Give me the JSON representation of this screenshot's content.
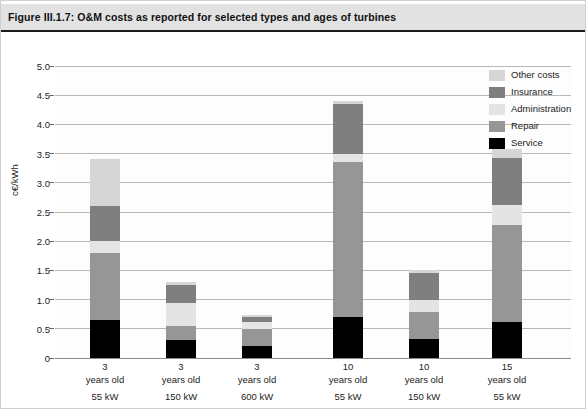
{
  "figure": {
    "title": "Figure III.1.7: O&M costs as reported for selected types and ages of turbines"
  },
  "colors": {
    "service": "#000000",
    "repair": "#969696",
    "administration": "#e4e4e4",
    "insurance": "#7f7f7f",
    "other_costs": "#d6d6d6",
    "gridline": "#b8b8b8",
    "banner_background": "#e2e2e2",
    "plot_background": "#fdfdfd"
  },
  "legend": {
    "position": "right",
    "items": [
      {
        "label": "Other costs",
        "color": "#d6d6d6"
      },
      {
        "label": "Insurance",
        "color": "#7f7f7f"
      },
      {
        "label": "Administration",
        "color": "#e4e4e4"
      },
      {
        "label": "Repair",
        "color": "#969696"
      },
      {
        "label": "Service",
        "color": "#000000"
      }
    ]
  },
  "chart_data": {
    "type": "bar",
    "stacked": true,
    "title": "Figure III.1.7: O&M costs as reported for selected types and ages of turbines",
    "xlabel": "",
    "ylabel": "c€/kWh",
    "ylim": [
      0,
      5.0
    ],
    "ytick_labels": [
      "0",
      "0.5",
      "1.0",
      "1.5",
      "2.0",
      "2.5",
      "3.0",
      "3.5",
      "4.0",
      "4.5",
      "5.0"
    ],
    "ytick_values": [
      0,
      0.5,
      1.0,
      1.5,
      2.0,
      2.5,
      3.0,
      3.5,
      4.0,
      4.5,
      5.0
    ],
    "grid": true,
    "categories": [
      {
        "age": "3",
        "age_unit": "years old",
        "rating": "55 kW"
      },
      {
        "age": "3",
        "age_unit": "years old",
        "rating": "150 kW"
      },
      {
        "age": "3",
        "age_unit": "years old",
        "rating": "600 kW"
      },
      {
        "age": "10",
        "age_unit": "years old",
        "rating": "55 kW"
      },
      {
        "age": "10",
        "age_unit": "years old",
        "rating": "150 kW"
      },
      {
        "age": "15",
        "age_unit": "years old",
        "rating": "55 kW"
      }
    ],
    "series": [
      {
        "name": "Service",
        "color": "#000000",
        "values": [
          0.65,
          0.3,
          0.2,
          0.7,
          0.32,
          0.62
        ]
      },
      {
        "name": "Repair",
        "color": "#969696",
        "values": [
          1.15,
          0.25,
          0.3,
          2.65,
          0.46,
          1.66
        ]
      },
      {
        "name": "Administration",
        "color": "#e4e4e4",
        "values": [
          0.2,
          0.4,
          0.12,
          0.15,
          0.22,
          0.34
        ]
      },
      {
        "name": "Insurance",
        "color": "#7f7f7f",
        "values": [
          0.6,
          0.3,
          0.08,
          0.85,
          0.45,
          0.8
        ]
      },
      {
        "name": "Other costs",
        "color": "#d6d6d6",
        "values": [
          0.8,
          0.05,
          0.03,
          0.05,
          0.05,
          0.16
        ]
      }
    ],
    "totals": [
      3.4,
      1.3,
      0.73,
      4.4,
      1.5,
      3.58
    ]
  }
}
